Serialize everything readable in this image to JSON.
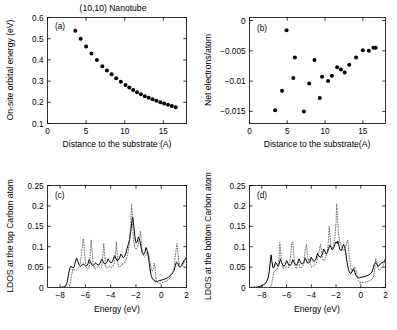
{
  "figure": {
    "title": "(10,10) Nanotube",
    "panels": [
      "(a)",
      "(b)",
      "(c)",
      "(d)"
    ]
  },
  "chart_data": [
    {
      "type": "scatter",
      "panel": "(a)",
      "title": "(10,10) Nanotube",
      "xlabel": "Distance to the substrate (A)",
      "ylabel": "On-site orbital energy (eV)",
      "xlim": [
        0,
        18
      ],
      "ylim": [
        0.1,
        0.6
      ],
      "xticks": [
        0,
        5,
        10,
        15
      ],
      "yticks": [
        0.1,
        0.2,
        0.3,
        0.4,
        0.5,
        0.6
      ],
      "ytick_labels": [
        "0.1",
        "0.2",
        "0.3",
        "0.4",
        "0.5",
        "0.6"
      ],
      "grid": false,
      "legend": "none",
      "marker": "filled-circle",
      "x": [
        3.6,
        4.3,
        5.0,
        5.7,
        6.4,
        7.1,
        7.7,
        8.3,
        8.9,
        9.5,
        10.1,
        10.6,
        11.1,
        11.6,
        12.1,
        12.6,
        13.1,
        13.6,
        14.1,
        14.6,
        15.1,
        15.6,
        16.1,
        16.6
      ],
      "y": [
        0.538,
        0.5,
        0.463,
        0.43,
        0.399,
        0.37,
        0.35,
        0.332,
        0.314,
        0.297,
        0.282,
        0.27,
        0.258,
        0.247,
        0.238,
        0.229,
        0.221,
        0.214,
        0.207,
        0.2,
        0.194,
        0.188,
        0.182,
        0.177
      ]
    },
    {
      "type": "scatter",
      "panel": "(b)",
      "xlabel": "Distance to the substrate(A)",
      "ylabel": "Net electrons/atom",
      "xlim": [
        0,
        18
      ],
      "ylim": [
        -0.017,
        0.0005
      ],
      "xticks": [
        0,
        5,
        10,
        15
      ],
      "yticks": [
        0,
        -0.005,
        -0.01,
        -0.015
      ],
      "ytick_labels": [
        "0",
        "-0.005",
        "-0.01",
        "-0.015"
      ],
      "grid": false,
      "legend": "none",
      "marker": "filled-circle",
      "x": [
        3.4,
        4.3,
        4.9,
        5.8,
        6.0,
        7.2,
        7.9,
        8.6,
        9.3,
        9.6,
        10.4,
        10.9,
        11.6,
        12.1,
        12.6,
        13.2,
        14.1,
        15.0,
        15.8,
        16.4,
        16.7
      ],
      "y": [
        -0.0148,
        -0.0116,
        -0.0016,
        -0.0095,
        -0.0061,
        -0.015,
        -0.0104,
        -0.0065,
        -0.0128,
        -0.0093,
        -0.01,
        -0.0091,
        -0.0077,
        -0.0081,
        -0.0086,
        -0.0073,
        -0.0061,
        -0.0049,
        -0.005,
        -0.0045,
        -0.0045
      ]
    },
    {
      "type": "line",
      "panel": "(c)",
      "xlabel": "Energy (eV)",
      "ylabel": "LDOS at the top Carbon atom",
      "xlim": [
        -9,
        2
      ],
      "ylim": [
        0,
        0.25
      ],
      "xticks": [
        -8,
        -6,
        -4,
        -2,
        0,
        2
      ],
      "yticks": [
        0,
        0.05,
        0.1,
        0.15,
        0.2,
        0.25
      ],
      "ytick_labels": [
        "0",
        "0.05",
        "0.1",
        "0.15",
        "0.2",
        "0.25"
      ],
      "grid": false,
      "legend": "none",
      "series": [
        {
          "name": "solid-ldos-top",
          "style": "solid",
          "x": [
            -9.0,
            -8.0,
            -7.6,
            -7.45,
            -7.35,
            -7.25,
            -7.15,
            -7.05,
            -6.95,
            -6.9,
            -6.8,
            -6.7,
            -6.6,
            -6.5,
            -6.4,
            -6.3,
            -6.2,
            -6.1,
            -6.0,
            -5.9,
            -5.8,
            -5.7,
            -5.6,
            -5.5,
            -5.4,
            -5.3,
            -5.2,
            -5.1,
            -5.0,
            -4.9,
            -4.8,
            -4.7,
            -4.6,
            -4.5,
            -4.4,
            -4.3,
            -4.2,
            -4.1,
            -4.0,
            -3.9,
            -3.8,
            -3.7,
            -3.6,
            -3.5,
            -3.4,
            -3.3,
            -3.2,
            -3.1,
            -3.0,
            -2.9,
            -2.8,
            -2.7,
            -2.6,
            -2.5,
            -2.4,
            -2.3,
            -2.25,
            -2.2,
            -2.1,
            -2.0,
            -1.9,
            -1.8,
            -1.7,
            -1.6,
            -1.5,
            -1.4,
            -1.3,
            -1.2,
            -1.1,
            -1.0,
            -0.9,
            -0.8,
            -0.7,
            -0.6,
            -0.5,
            -0.4,
            -0.3,
            -0.2,
            -0.1,
            0.0,
            0.2,
            0.4,
            0.6,
            0.8,
            1.0,
            1.1,
            1.2,
            1.3,
            1.4,
            1.5,
            1.6,
            1.7,
            1.8,
            1.9,
            2.0
          ],
          "y": [
            0.0,
            0.0,
            0.002,
            0.012,
            0.03,
            0.046,
            0.052,
            0.05,
            0.048,
            0.05,
            0.062,
            0.072,
            0.064,
            0.055,
            0.052,
            0.054,
            0.058,
            0.056,
            0.053,
            0.053,
            0.058,
            0.069,
            0.063,
            0.056,
            0.054,
            0.056,
            0.06,
            0.058,
            0.055,
            0.056,
            0.062,
            0.07,
            0.064,
            0.058,
            0.058,
            0.062,
            0.07,
            0.065,
            0.061,
            0.062,
            0.068,
            0.078,
            0.072,
            0.066,
            0.067,
            0.072,
            0.082,
            0.078,
            0.073,
            0.076,
            0.084,
            0.096,
            0.106,
            0.118,
            0.14,
            0.168,
            0.172,
            0.16,
            0.128,
            0.11,
            0.112,
            0.124,
            0.116,
            0.1,
            0.085,
            0.08,
            0.086,
            0.098,
            0.09,
            0.072,
            0.048,
            0.03,
            0.022,
            0.018,
            0.016,
            0.015,
            0.015,
            0.016,
            0.017,
            0.018,
            0.02,
            0.022,
            0.026,
            0.032,
            0.04,
            0.052,
            0.062,
            0.06,
            0.052,
            0.05,
            0.054,
            0.06,
            0.066,
            0.07,
            0.074,
            0.08
          ]
        },
        {
          "name": "dotted-ldos-isolated",
          "style": "dotted",
          "x": [
            -9.0,
            -8.0,
            -7.3,
            -7.2,
            -7.1,
            -7.0,
            -6.9,
            -6.8,
            -6.7,
            -6.6,
            -6.5,
            -6.4,
            -6.3,
            -6.2,
            -6.15,
            -6.1,
            -6.0,
            -5.9,
            -5.8,
            -5.7,
            -5.6,
            -5.55,
            -5.5,
            -5.4,
            -5.3,
            -5.2,
            -5.1,
            -5.0,
            -4.9,
            -4.8,
            -4.7,
            -4.6,
            -4.55,
            -4.5,
            -4.4,
            -4.3,
            -4.2,
            -4.1,
            -4.0,
            -3.9,
            -3.8,
            -3.7,
            -3.6,
            -3.55,
            -3.5,
            -3.4,
            -3.3,
            -3.2,
            -3.1,
            -3.0,
            -2.9,
            -2.8,
            -2.7,
            -2.6,
            -2.5,
            -2.4,
            -2.35,
            -2.3,
            -2.2,
            -2.1,
            -2.0,
            -1.9,
            -1.8,
            -1.7,
            -1.65,
            -1.6,
            -1.5,
            -1.4,
            -1.3,
            -1.2,
            -1.1,
            -1.0,
            -0.9,
            -0.8,
            -0.7,
            -0.6,
            -0.55,
            -0.5,
            -0.45,
            -0.4,
            -0.3,
            -0.2,
            -0.1,
            0.0,
            0.2,
            0.4,
            0.6,
            0.8,
            1.0,
            1.1,
            1.2,
            1.25,
            1.3,
            1.4,
            1.5,
            1.6,
            1.7,
            1.8,
            1.9,
            2.0
          ],
          "y": [
            0.0,
            0.0,
            0.0,
            0.01,
            0.03,
            0.045,
            0.044,
            0.042,
            0.043,
            0.046,
            0.05,
            0.06,
            0.085,
            0.115,
            0.12,
            0.098,
            0.06,
            0.048,
            0.046,
            0.048,
            0.09,
            0.116,
            0.1,
            0.06,
            0.048,
            0.046,
            0.048,
            0.052,
            0.05,
            0.048,
            0.05,
            0.085,
            0.108,
            0.09,
            0.052,
            0.048,
            0.05,
            0.052,
            0.05,
            0.05,
            0.052,
            0.06,
            0.09,
            0.112,
            0.086,
            0.052,
            0.05,
            0.052,
            0.056,
            0.058,
            0.06,
            0.066,
            0.076,
            0.09,
            0.115,
            0.165,
            0.205,
            0.18,
            0.12,
            0.098,
            0.094,
            0.098,
            0.108,
            0.128,
            0.138,
            0.12,
            0.09,
            0.078,
            0.074,
            0.08,
            0.09,
            0.084,
            0.066,
            0.046,
            0.04,
            0.048,
            0.06,
            0.052,
            0.035,
            0.02,
            0.012,
            0.01,
            0.01,
            0.011,
            0.013,
            0.016,
            0.02,
            0.028,
            0.046,
            0.072,
            0.098,
            0.108,
            0.09,
            0.062,
            0.052,
            0.05,
            0.054,
            0.06,
            0.066,
            0.074,
            0.086
          ]
        }
      ]
    },
    {
      "type": "line",
      "panel": "(d)",
      "xlabel": "Energy (eV)",
      "ylabel": "LDOS at the bottom Carbon atom",
      "xlim": [
        -9,
        2
      ],
      "ylim": [
        0,
        0.25
      ],
      "xticks": [
        -8,
        -6,
        -4,
        -2,
        0,
        2
      ],
      "yticks": [
        0,
        0.05,
        0.1,
        0.15,
        0.2,
        0.25
      ],
      "ytick_labels": [
        "0",
        "0.05",
        "0.1",
        "0.15",
        "0.2",
        "0.25"
      ],
      "grid": false,
      "legend": "none",
      "series": [
        {
          "name": "solid-ldos-bottom",
          "style": "solid",
          "x": [
            -9.0,
            -8.4,
            -8.1,
            -7.9,
            -7.7,
            -7.5,
            -7.4,
            -7.3,
            -7.25,
            -7.2,
            -7.1,
            -7.0,
            -6.9,
            -6.8,
            -6.7,
            -6.6,
            -6.5,
            -6.4,
            -6.3,
            -6.2,
            -6.1,
            -6.0,
            -5.9,
            -5.8,
            -5.7,
            -5.6,
            -5.5,
            -5.4,
            -5.3,
            -5.2,
            -5.1,
            -5.0,
            -4.9,
            -4.8,
            -4.7,
            -4.6,
            -4.5,
            -4.4,
            -4.3,
            -4.2,
            -4.1,
            -4.0,
            -3.9,
            -3.8,
            -3.7,
            -3.6,
            -3.5,
            -3.4,
            -3.3,
            -3.2,
            -3.1,
            -3.0,
            -2.9,
            -2.8,
            -2.7,
            -2.6,
            -2.5,
            -2.4,
            -2.3,
            -2.2,
            -2.1,
            -2.0,
            -1.9,
            -1.85,
            -1.8,
            -1.7,
            -1.6,
            -1.5,
            -1.4,
            -1.3,
            -1.2,
            -1.1,
            -1.0,
            -0.9,
            -0.8,
            -0.7,
            -0.6,
            -0.5,
            -0.4,
            -0.3,
            -0.2,
            -0.1,
            0.0,
            0.2,
            0.4,
            0.6,
            0.8,
            0.9,
            1.0,
            1.1,
            1.2,
            1.3,
            1.4,
            1.5,
            1.6,
            1.7,
            1.8,
            1.9,
            2.0
          ],
          "y": [
            0.0,
            0.001,
            0.003,
            0.006,
            0.01,
            0.022,
            0.04,
            0.068,
            0.08,
            0.066,
            0.048,
            0.05,
            0.062,
            0.058,
            0.052,
            0.058,
            0.07,
            0.062,
            0.054,
            0.052,
            0.056,
            0.066,
            0.06,
            0.054,
            0.054,
            0.058,
            0.068,
            0.062,
            0.056,
            0.055,
            0.06,
            0.07,
            0.064,
            0.058,
            0.058,
            0.062,
            0.072,
            0.066,
            0.06,
            0.06,
            0.064,
            0.074,
            0.068,
            0.064,
            0.066,
            0.072,
            0.084,
            0.078,
            0.074,
            0.076,
            0.082,
            0.094,
            0.088,
            0.082,
            0.086,
            0.096,
            0.104,
            0.098,
            0.092,
            0.096,
            0.106,
            0.112,
            0.108,
            0.114,
            0.106,
            0.094,
            0.09,
            0.096,
            0.106,
            0.1,
            0.082,
            0.06,
            0.044,
            0.036,
            0.034,
            0.04,
            0.046,
            0.04,
            0.03,
            0.026,
            0.024,
            0.024,
            0.025,
            0.026,
            0.028,
            0.03,
            0.034,
            0.038,
            0.046,
            0.058,
            0.062,
            0.056,
            0.052,
            0.054,
            0.058,
            0.06,
            0.062,
            0.064,
            0.07
          ]
        },
        {
          "name": "dotted-ldos-isolated",
          "style": "dotted",
          "x": [
            -9.0,
            -8.0,
            -7.3,
            -7.2,
            -7.1,
            -7.0,
            -6.9,
            -6.8,
            -6.7,
            -6.6,
            -6.55,
            -6.5,
            -6.4,
            -6.3,
            -6.2,
            -6.1,
            -6.05,
            -6.0,
            -5.9,
            -5.8,
            -5.7,
            -5.6,
            -5.5,
            -5.4,
            -5.3,
            -5.2,
            -5.1,
            -5.05,
            -5.0,
            -4.9,
            -4.8,
            -4.7,
            -4.6,
            -4.5,
            -4.4,
            -4.3,
            -4.2,
            -4.15,
            -4.1,
            -4.0,
            -3.9,
            -3.8,
            -3.7,
            -3.6,
            -3.5,
            -3.4,
            -3.3,
            -3.25,
            -3.2,
            -3.1,
            -3.0,
            -2.9,
            -2.8,
            -2.7,
            -2.6,
            -2.55,
            -2.5,
            -2.4,
            -2.3,
            -2.2,
            -2.1,
            -2.0,
            -1.95,
            -1.9,
            -1.8,
            -1.7,
            -1.6,
            -1.5,
            -1.4,
            -1.3,
            -1.2,
            -1.1,
            -1.05,
            -1.0,
            -0.9,
            -0.8,
            -0.7,
            -0.6,
            -0.5,
            -0.4,
            -0.3,
            -0.2,
            -0.1,
            0.0,
            0.2,
            0.4,
            0.6,
            0.8,
            1.0,
            1.1,
            1.15,
            1.2,
            1.3,
            1.4,
            1.5,
            1.6,
            1.7,
            1.8,
            1.9,
            2.0
          ],
          "y": [
            0.0,
            0.0,
            0.0,
            0.008,
            0.026,
            0.04,
            0.042,
            0.044,
            0.05,
            0.075,
            0.11,
            0.095,
            0.06,
            0.048,
            0.046,
            0.05,
            0.052,
            0.05,
            0.048,
            0.05,
            0.07,
            0.105,
            0.112,
            0.08,
            0.05,
            0.046,
            0.06,
            0.068,
            0.058,
            0.048,
            0.048,
            0.052,
            0.06,
            0.09,
            0.106,
            0.076,
            0.064,
            0.07,
            0.062,
            0.05,
            0.05,
            0.052,
            0.056,
            0.06,
            0.07,
            0.084,
            0.1,
            0.106,
            0.092,
            0.07,
            0.066,
            0.07,
            0.076,
            0.086,
            0.12,
            0.15,
            0.13,
            0.1,
            0.096,
            0.104,
            0.12,
            0.16,
            0.205,
            0.18,
            0.13,
            0.112,
            0.104,
            0.096,
            0.09,
            0.094,
            0.102,
            0.112,
            0.116,
            0.098,
            0.07,
            0.048,
            0.038,
            0.042,
            0.05,
            0.044,
            0.03,
            0.018,
            0.012,
            0.012,
            0.012,
            0.013,
            0.015,
            0.018,
            0.024,
            0.036,
            0.056,
            0.07,
            0.062,
            0.048,
            0.042,
            0.044,
            0.048,
            0.054,
            0.06,
            0.068,
            0.08
          ]
        }
      ]
    }
  ]
}
